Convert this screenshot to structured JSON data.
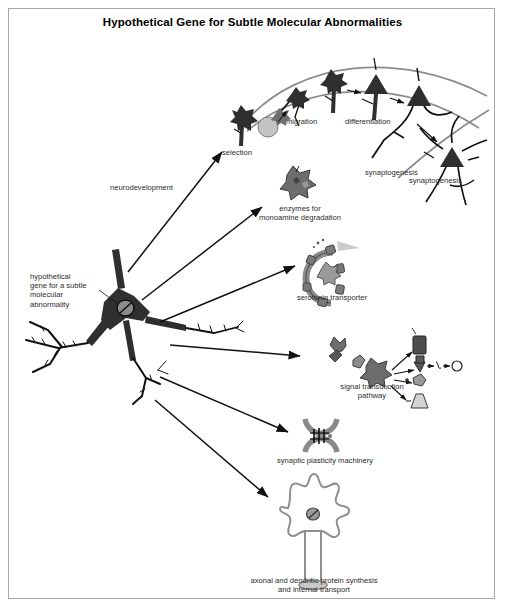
{
  "figure": {
    "title": "Hypothetical Gene for Subtle Molecular Abnormalities",
    "border_color": "#a8a8a8",
    "background": "#ffffff",
    "text_color": "#2b2b2b"
  },
  "source_neuron": {
    "label": "hypothetical\ngene for a subtle\nmolecular\nabnormality",
    "nucleus_icon": "gene-nucleus-icon"
  },
  "branches": {
    "neurodevelopment": {
      "label": "neurodevelopment",
      "stages": [
        {
          "label": "selection",
          "icon": "star-neuron-icon"
        },
        {
          "label": "migration",
          "icon": "migrating-neuron-icon"
        },
        {
          "label": "differentiation",
          "icon": "differentiating-neuron-icon"
        },
        {
          "label": "synaptogenesis",
          "icon": "synapse-forming-neuron-icon"
        },
        {
          "label": "synaptogenesis",
          "icon": "mature-neuron-icon"
        }
      ]
    },
    "targets": [
      {
        "label": "enzymes for\nmonoamine degradation",
        "icon": "enzyme-blob-icon"
      },
      {
        "label": "serotonin transporter",
        "icon": "transporter-ring-icon"
      },
      {
        "label": "signal transduction\npathway",
        "icon": "signaling-cascade-icon"
      },
      {
        "label": "synaptic plasticity machinery",
        "icon": "synapse-cleft-icon"
      },
      {
        "label": "axonal and dendritic protein synthesis\nand internal transport",
        "icon": "soma-transport-icon"
      }
    ]
  }
}
